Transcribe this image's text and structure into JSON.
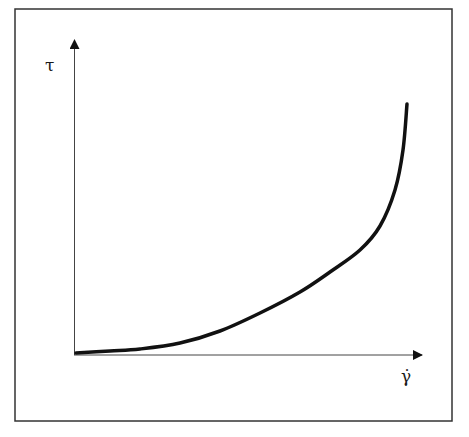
{
  "chart_data": {
    "type": "line",
    "title": "",
    "xlabel": "γ̇",
    "ylabel": "τ",
    "grid": false,
    "legend": null,
    "x_ticks": [],
    "y_ticks": [],
    "series": [
      {
        "name": "shear-thickening fluid",
        "points_px": [
          [
            76,
            353
          ],
          [
            110,
            351
          ],
          [
            140,
            349
          ],
          [
            180,
            343
          ],
          [
            220,
            331
          ],
          [
            260,
            313
          ],
          [
            300,
            292
          ],
          [
            330,
            272
          ],
          [
            360,
            250
          ],
          [
            380,
            226
          ],
          [
            395,
            190
          ],
          [
            403,
            150
          ],
          [
            407,
            104
          ]
        ]
      }
    ],
    "colors": {
      "curve": "#111111",
      "axes": "#333333",
      "frame": "#333333"
    }
  },
  "labels": {
    "y_axis": "τ",
    "x_axis": "γ̇"
  }
}
